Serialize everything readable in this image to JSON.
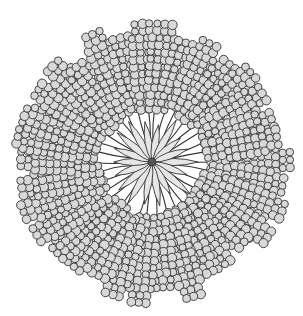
{
  "image": {
    "subject": "radial illustration of branching lobed clusters around a central star",
    "width": 303,
    "height": 316,
    "center": {
      "x": 152,
      "y": 162
    },
    "colors": {
      "background": "#ffffff",
      "ink": "#333333",
      "cell_fill": "#d8d8d8",
      "core_fill": "#e6e6e6"
    },
    "lobes": {
      "count": 34,
      "inner_radius": 52,
      "outer_radius": 146,
      "cell_radius": 4.2,
      "rows": 3
    },
    "core": {
      "petals": 18,
      "petal_length": 44,
      "petal_width": 7
    }
  }
}
